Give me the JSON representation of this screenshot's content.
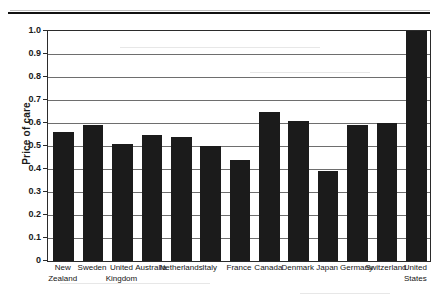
{
  "chart_data": {
    "type": "bar",
    "title": "",
    "xlabel": "",
    "ylabel": "Price of care",
    "ylim": [
      0,
      1.0
    ],
    "grid": true,
    "legend": "none",
    "orientation": "vertical",
    "bar_color": "#1b1b1b",
    "categories": [
      "New Zealand",
      "Sweden",
      "United Kingdom",
      "Australia",
      "Netherlands",
      "Italy",
      "France",
      "Canada",
      "Denmark",
      "Japan",
      "Germany",
      "Switzerland",
      "United States"
    ],
    "category_lines": [
      [
        "New",
        "Zealand"
      ],
      [
        "Sweden",
        ""
      ],
      [
        "United",
        "Kingdom"
      ],
      [
        "Australia",
        ""
      ],
      [
        "Netherlands",
        ""
      ],
      [
        "Italy",
        ""
      ],
      [
        "France",
        ""
      ],
      [
        "Canada",
        ""
      ],
      [
        "Denmark",
        ""
      ],
      [
        "Japan",
        ""
      ],
      [
        "Germany",
        ""
      ],
      [
        "Switzerland",
        ""
      ],
      [
        "United",
        "States"
      ]
    ],
    "values": [
      0.56,
      0.59,
      0.51,
      0.55,
      0.54,
      0.5,
      0.44,
      0.65,
      0.61,
      0.39,
      0.59,
      0.6,
      1.0
    ],
    "ytick_labels": [
      "1.0",
      "0.9",
      "0.8",
      "0.7",
      "0.6",
      "0.5",
      "0.4",
      "0.3",
      "0.2",
      "0.1",
      "0"
    ],
    "ytick_values": [
      1.0,
      0.9,
      0.8,
      0.7,
      0.6,
      0.5,
      0.4,
      0.3,
      0.2,
      0.1,
      0.0
    ]
  }
}
